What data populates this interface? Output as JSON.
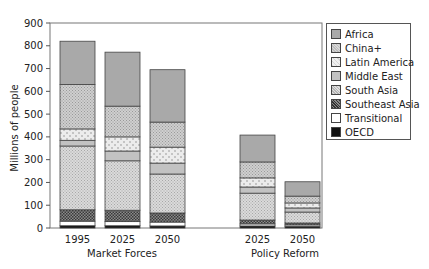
{
  "chart_data": {
    "type": "bar",
    "stacked": true,
    "title": "",
    "xlabel": "",
    "ylabel": "Millions of people",
    "ylim": [
      0,
      900
    ],
    "yticks": [
      0,
      100,
      200,
      300,
      400,
      500,
      600,
      700,
      800,
      900
    ],
    "grid": false,
    "legend_position": "right",
    "categories": [
      "1995",
      "2025",
      "2050",
      "2025",
      "2050"
    ],
    "groups": [
      {
        "label": "Market Forces",
        "categories": [
          "1995",
          "2025",
          "2050"
        ]
      },
      {
        "label": "Policy Reform",
        "categories": [
          "2025",
          "2050"
        ]
      }
    ],
    "series": [
      {
        "name": "OECD",
        "values": [
          10,
          10,
          9,
          9,
          8
        ]
      },
      {
        "name": "Transitional",
        "values": [
          20,
          18,
          17,
          9,
          6
        ]
      },
      {
        "name": "Southeast Asia",
        "values": [
          50,
          50,
          40,
          17,
          8
        ]
      },
      {
        "name": "South Asia",
        "values": [
          280,
          217,
          171,
          118,
          48
        ]
      },
      {
        "name": "Middle East",
        "values": [
          25,
          43,
          48,
          27,
          18
        ]
      },
      {
        "name": "Latin America",
        "values": [
          50,
          62,
          70,
          40,
          22
        ]
      },
      {
        "name": "China+",
        "values": [
          195,
          135,
          110,
          70,
          30
        ]
      },
      {
        "name": "Africa",
        "values": [
          190,
          237,
          230,
          118,
          63
        ]
      }
    ],
    "totals": [
      820,
      772,
      695,
      408,
      203
    ]
  },
  "legend": {
    "items": [
      {
        "label": "Africa",
        "pattern": "africa"
      },
      {
        "label": "China+",
        "pattern": "china"
      },
      {
        "label": "Latin America",
        "pattern": "latam"
      },
      {
        "label": "Middle East",
        "pattern": "mideast"
      },
      {
        "label": "South Asia",
        "pattern": "sasia"
      },
      {
        "label": "Southeast Asia",
        "pattern": "seasia"
      },
      {
        "label": "Transitional",
        "pattern": "trans"
      },
      {
        "label": "OECD",
        "pattern": "oecd"
      }
    ]
  },
  "axis": {
    "y_title": "Millions of people",
    "x_ticks": [
      "1995",
      "2025",
      "2050",
      "2025",
      "2050"
    ],
    "group_labels": [
      "Market Forces",
      "Policy Reform"
    ]
  }
}
